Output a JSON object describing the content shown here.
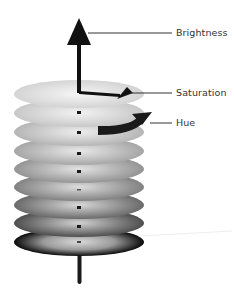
{
  "diagram": {
    "labels": {
      "brightness": "Brightness",
      "saturation": "Saturation",
      "hue": "Hue"
    },
    "discs": [
      {
        "cy": 94,
        "edge": "#d2d2d2",
        "center": "#f4f4f4"
      },
      {
        "cy": 113,
        "edge": "#c8c8c8",
        "center": "#f0f0f0"
      },
      {
        "cy": 132,
        "edge": "#b8b8b8",
        "center": "#ececec"
      },
      {
        "cy": 151,
        "edge": "#a8a8a8",
        "center": "#e6e6e6"
      },
      {
        "cy": 169,
        "edge": "#969696",
        "center": "#e0e0e0"
      },
      {
        "cy": 187,
        "edge": "#858585",
        "center": "#dcdcdc"
      },
      {
        "cy": 205,
        "edge": "#6e6e6e",
        "center": "#d6d6d6"
      },
      {
        "cy": 223,
        "edge": "#555555",
        "center": "#d0d0d0"
      },
      {
        "cy": 242,
        "edge": "#111111",
        "center": "#d4d4d4"
      }
    ],
    "colors": {
      "arrow": "#111111",
      "leader_line": "#333333",
      "text": "#333333"
    }
  }
}
